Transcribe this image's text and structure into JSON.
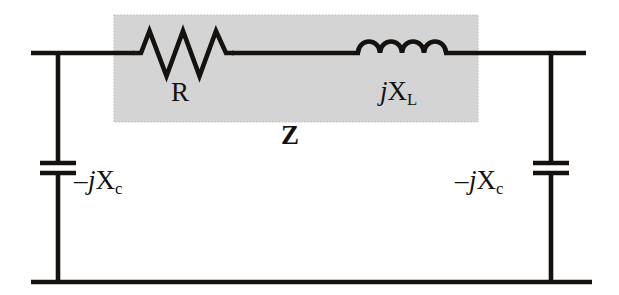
{
  "diagram": {
    "type": "circuit-schematic",
    "background_color": "#ffffff",
    "wire_color": "#14110f",
    "shaded_box_color": "#d4d4d4",
    "shaded_box_border_color": "#b4b4b4",
    "canvas": {
      "width": 619,
      "height": 295
    }
  },
  "labels": {
    "resistor": "R",
    "inductor_prefix": "j",
    "inductor_symbol": "X",
    "inductor_subscript": "L",
    "impedance": "Z",
    "capacitor_sign": "–",
    "capacitor_prefix": "j",
    "capacitor_symbol": "X",
    "capacitor_subscript": "c"
  },
  "components": [
    {
      "name": "resistor",
      "kind": "resistor",
      "label": "R",
      "zigzag_peaks": 3,
      "x_start": 133,
      "x_end": 233,
      "y_center": 53,
      "amplitude": 23,
      "inside_shaded_box": true
    },
    {
      "name": "inductor",
      "kind": "inductor",
      "label": "jX_L",
      "arcs": 4,
      "x_start": 358,
      "x_end": 446,
      "y_center": 53,
      "arc_radius": 11,
      "inside_shaded_box": true
    },
    {
      "name": "capacitor-left",
      "kind": "capacitor",
      "label": "-jX_c",
      "x_center": 58,
      "plate_top_y": 163,
      "plate_bottom_y": 173,
      "plate_half_width": 18,
      "label_side": "right"
    },
    {
      "name": "capacitor-right",
      "kind": "capacitor",
      "label": "-jX_c",
      "x_center": 551,
      "plate_top_y": 163,
      "plate_bottom_y": 173,
      "plate_half_width": 18,
      "label_side": "left"
    }
  ],
  "shaded_box": {
    "name": "impedance-region",
    "label": "Z",
    "x": 114,
    "y": 15,
    "width": 364,
    "height": 107
  },
  "wires": [
    {
      "name": "top-rail",
      "x1": 31,
      "y1": 53,
      "x2": 586,
      "y2": 53
    },
    {
      "name": "bottom-rail",
      "x1": 31,
      "y1": 282,
      "x2": 592,
      "y2": 282
    },
    {
      "name": "left-branch",
      "x1": 58,
      "y1": 53,
      "x2": 58,
      "y2": 282
    },
    {
      "name": "right-branch",
      "x1": 551,
      "y1": 53,
      "x2": 551,
      "y2": 282
    }
  ]
}
